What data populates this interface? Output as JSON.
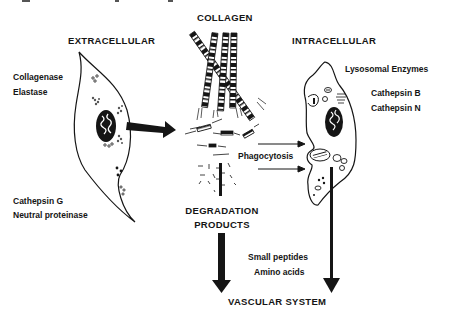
{
  "diagram": {
    "headings": {
      "collagen": "COLLAGEN",
      "extracellular": "EXTRACELLULAR",
      "intracellular": "INTRACELLULAR",
      "degradation_line1": "DEGRADATION",
      "degradation_line2": "PRODUCTS",
      "vascular": "VASCULAR SYSTEM"
    },
    "extracellular_enzymes": {
      "group1": [
        "Collagenase",
        "Elastase"
      ],
      "group2": [
        "Cathepsin G",
        "Neutral proteinase"
      ]
    },
    "intracellular_enzymes": {
      "title": "Lysosomal Enzymes",
      "items": [
        "Cathepsin B",
        "Cathepsin N"
      ]
    },
    "process_labels": {
      "phagocytosis": "Phagocytosis"
    },
    "products": [
      "Small peptides",
      "Amino acids"
    ],
    "colors": {
      "ink": "#151515",
      "background": "#ffffff"
    }
  }
}
